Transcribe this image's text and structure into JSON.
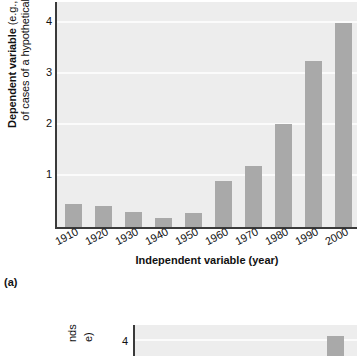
{
  "figure_a": {
    "caption": "(a)",
    "ylabel_line1": "Dependent variable",
    "ylabel_line1_tail": " (e.g., thousands",
    "ylabel_line2": "of cases of a hypothetical disease)",
    "xlabel": "Independent variable (year)",
    "yticks": [
      "4",
      "3",
      "2",
      "1"
    ],
    "colors": {
      "bar": "#a9a9a9",
      "plot_background": "#ededed",
      "gridline": "#fbfbfb",
      "axis": "#3a3a3a",
      "text": "#111111"
    }
  },
  "figure_b": {
    "ytick": "4",
    "ylabel_fragment_1": "nds",
    "ylabel_fragment_2": "e)"
  },
  "chart_data": {
    "type": "bar",
    "title": "",
    "xlabel": "Independent variable (year)",
    "ylabel": "Dependent variable (e.g., thousands of cases of a hypothetical disease)",
    "categories": [
      "1910",
      "1920",
      "1930",
      "1940",
      "1950",
      "1960",
      "1970",
      "1980",
      "1990",
      "2000"
    ],
    "values": [
      0.45,
      0.42,
      0.3,
      0.17,
      0.28,
      0.9,
      1.2,
      2.02,
      3.25,
      4.0
    ],
    "ylim": [
      0,
      4.45
    ],
    "yticks": [
      1,
      2,
      3,
      4
    ],
    "grid": true,
    "legend": false,
    "series_color": "#a9a9a9"
  },
  "chart_data_b": {
    "type": "bar",
    "note": "second panel (b), only top edge visible",
    "yticks": [
      4
    ],
    "visible_bars": [
      4.0
    ]
  }
}
